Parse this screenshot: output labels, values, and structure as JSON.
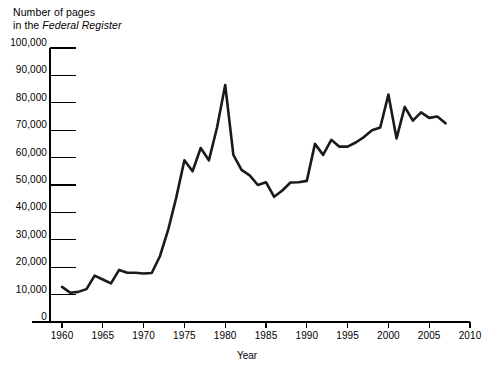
{
  "chart_data": {
    "type": "line",
    "title": "Number of pages in the Federal Register",
    "title_line1": "Number of pages",
    "title_line2_prefix": "in the ",
    "title_line2_italic": "Federal Register",
    "xlabel": "Year",
    "ylabel": "",
    "xlim": [
      1960,
      2010
    ],
    "ylim": [
      0,
      100000
    ],
    "grid": false,
    "legend": null,
    "xticks": [
      1960,
      1965,
      1970,
      1975,
      1980,
      1985,
      1990,
      1995,
      2000,
      2005,
      2010
    ],
    "xtick_labels": [
      "1960",
      "1965",
      "1970",
      "1975",
      "1980",
      "1985",
      "1990",
      "1995",
      "2000",
      "2005",
      "2010"
    ],
    "yticks": [
      0,
      10000,
      20000,
      30000,
      40000,
      50000,
      60000,
      70000,
      80000,
      90000,
      100000
    ],
    "ytick_labels": [
      "0",
      "10,000",
      "20,000",
      "30,000",
      "40,000",
      "50,000",
      "60,000",
      "70,000",
      "80,000",
      "90,000",
      "100,000"
    ],
    "line_color": "#1a1a1a",
    "x": [
      1960,
      1961,
      1962,
      1963,
      1964,
      1965,
      1966,
      1967,
      1968,
      1969,
      1970,
      1971,
      1972,
      1973,
      1974,
      1975,
      1976,
      1977,
      1978,
      1979,
      1980,
      1981,
      1982,
      1983,
      1984,
      1985,
      1986,
      1987,
      1988,
      1989,
      1990,
      1991,
      1992,
      1993,
      1994,
      1995,
      1996,
      1997,
      1998,
      1999,
      2000,
      2001,
      2002,
      2003,
      2004,
      2005,
      2006,
      2007
    ],
    "values": [
      12800,
      10700,
      11000,
      12000,
      16900,
      15500,
      14100,
      19000,
      18000,
      18000,
      17700,
      17900,
      24000,
      33500,
      45400,
      59000,
      55000,
      63500,
      59000,
      71000,
      86500,
      61000,
      55500,
      53500,
      50000,
      51000,
      45700,
      48000,
      50900,
      51000,
      51500,
      65000,
      61000,
      66500,
      64000,
      64000,
      65500,
      67500,
      70000,
      71000,
      83000,
      67000,
      78500,
      73500,
      76500,
      74500,
      75000,
      72500
    ],
    "series_name": "Federal Register pages"
  },
  "axis": {
    "y_axis_name": "y-axis",
    "x_axis_name": "x-axis"
  }
}
